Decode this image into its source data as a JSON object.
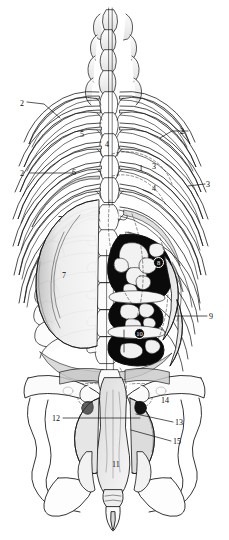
{
  "figure": {
    "view": "dorsal",
    "style": "black-and-white stipple and line engraving",
    "background_color": "#ffffff",
    "ink_color": "#101010"
  },
  "labels": [
    {
      "id": "label-2-upper-left",
      "text": "2",
      "x": 20,
      "y": 100,
      "leader": "diagonal-down-right",
      "on_dark": false,
      "circled": false
    },
    {
      "id": "label-5",
      "text": "5",
      "x": 80,
      "y": 131,
      "leader": "none",
      "on_dark": false,
      "circled": false
    },
    {
      "id": "label-2-upper-right",
      "text": "2",
      "x": 180,
      "y": 128,
      "leader": "diagonal-up-left",
      "on_dark": false,
      "circled": false
    },
    {
      "id": "label-4-upper",
      "text": "4",
      "x": 105,
      "y": 141,
      "leader": "none",
      "on_dark": false,
      "circled": false
    },
    {
      "id": "label-2-lower-left",
      "text": "2",
      "x": 20,
      "y": 170,
      "leader": "horizontal-right",
      "on_dark": false,
      "circled": false
    },
    {
      "id": "label-6",
      "text": "6",
      "x": 72,
      "y": 169,
      "leader": "none",
      "on_dark": false,
      "circled": false
    },
    {
      "id": "label-1",
      "text": "1",
      "x": 139,
      "y": 165,
      "leader": "none",
      "on_dark": false,
      "circled": false
    },
    {
      "id": "label-3-mid",
      "text": "3",
      "x": 152,
      "y": 163,
      "leader": "none",
      "on_dark": false,
      "circled": false
    },
    {
      "id": "label-3-right",
      "text": "3",
      "x": 206,
      "y": 181,
      "leader": "horizontal-left",
      "on_dark": false,
      "circled": false
    },
    {
      "id": "label-4-lower",
      "text": "4",
      "x": 152,
      "y": 185,
      "leader": "none",
      "on_dark": false,
      "circled": false
    },
    {
      "id": "label-7-upper",
      "text": "7",
      "x": 58,
      "y": 216,
      "leader": "none",
      "on_dark": false,
      "circled": false
    },
    {
      "id": "label-7-lower",
      "text": "7",
      "x": 62,
      "y": 272,
      "leader": "none",
      "on_dark": false,
      "circled": false
    },
    {
      "id": "label-8",
      "text": "8",
      "x": 153,
      "y": 257,
      "leader": "none",
      "on_dark": true,
      "circled": true
    },
    {
      "id": "label-9",
      "text": "9",
      "x": 209,
      "y": 313,
      "leader": "horizontal-left",
      "on_dark": false,
      "circled": false
    },
    {
      "id": "label-10",
      "text": "10",
      "x": 134,
      "y": 328,
      "leader": "none",
      "on_dark": true,
      "circled": true
    },
    {
      "id": "label-14",
      "text": "14",
      "x": 161,
      "y": 397,
      "leader": "none",
      "on_dark": false,
      "circled": false
    },
    {
      "id": "label-12",
      "text": "12",
      "x": 52,
      "y": 415,
      "leader": "horizontal-right",
      "on_dark": false,
      "circled": false
    },
    {
      "id": "label-13",
      "text": "13",
      "x": 175,
      "y": 419,
      "leader": "horizontal-left",
      "on_dark": false,
      "circled": false
    },
    {
      "id": "label-15",
      "text": "15",
      "x": 173,
      "y": 438,
      "leader": "horizontal-left",
      "on_dark": false,
      "circled": false
    },
    {
      "id": "label-11",
      "text": "11",
      "x": 112,
      "y": 461,
      "leader": "none",
      "on_dark": false,
      "circled": false
    }
  ]
}
